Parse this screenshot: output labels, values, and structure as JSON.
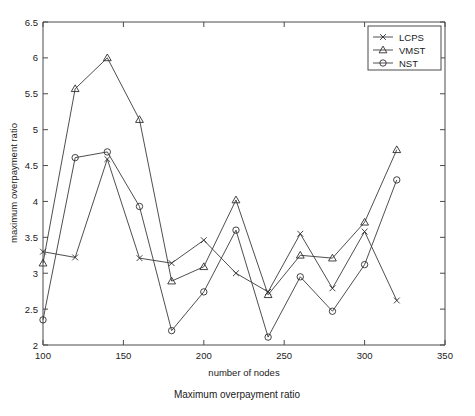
{
  "figure": {
    "caption": "Maximum overpayment ratio",
    "background": "#ffffff",
    "line_color": "#3a3a3a",
    "axis_color": "#4a4a4a"
  },
  "chart_data": {
    "type": "line",
    "title": "",
    "subtitle": "",
    "xlabel": "number of nodes",
    "ylabel": "maximum overpayment ratio",
    "xlim": [
      100,
      350
    ],
    "ylim": [
      2,
      6.5
    ],
    "xticks": [
      100,
      150,
      200,
      250,
      300,
      350
    ],
    "xtick_labels": [
      "100",
      "150",
      "200",
      "250",
      "300",
      "350"
    ],
    "yticks": [
      2,
      2.5,
      3,
      3.5,
      4,
      4.5,
      5,
      5.5,
      6,
      6.5
    ],
    "ytick_labels": [
      "2",
      "2.5",
      "3",
      "3.5",
      "4",
      "4.5",
      "5",
      "5.5",
      "6",
      "6.5"
    ],
    "grid": false,
    "legend_position": "top-right",
    "x": [
      100,
      120,
      140,
      160,
      180,
      200,
      220,
      240,
      260,
      280,
      300,
      320
    ],
    "series": [
      {
        "name": "LCPS",
        "marker": "x",
        "values": [
          3.3,
          3.22,
          4.59,
          3.21,
          3.14,
          3.46,
          3.0,
          2.74,
          3.55,
          2.79,
          3.58,
          2.62
        ]
      },
      {
        "name": "VMST",
        "marker": "triangle",
        "values": [
          3.14,
          5.57,
          6.0,
          5.14,
          2.89,
          3.09,
          4.02,
          2.7,
          3.25,
          3.21,
          3.71,
          4.72
        ]
      },
      {
        "name": "NST",
        "marker": "circle",
        "values": [
          2.35,
          4.61,
          4.69,
          3.93,
          2.2,
          2.74,
          3.6,
          2.11,
          2.95,
          2.47,
          3.12,
          4.3
        ]
      }
    ]
  },
  "legend": {
    "entries": [
      {
        "label": "LCPS",
        "marker": "x"
      },
      {
        "label": "VMST",
        "marker": "triangle"
      },
      {
        "label": "NST",
        "marker": "circle"
      }
    ]
  }
}
